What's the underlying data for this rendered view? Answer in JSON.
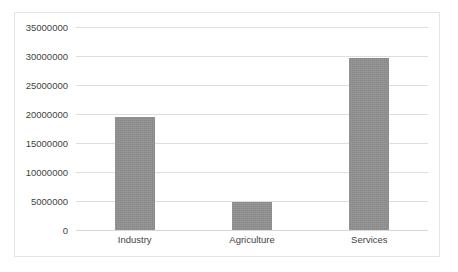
{
  "chart_data": {
    "type": "bar",
    "title": "",
    "subtitle": "",
    "xlabel": "",
    "ylabel": "",
    "categories": [
      "Industry",
      "Agriculture",
      "Services"
    ],
    "values": [
      19500000,
      4800000,
      29600000
    ],
    "series": [
      {
        "name": "",
        "values": [
          19500000,
          4800000,
          29600000
        ]
      }
    ],
    "ylim": [
      0,
      35000000
    ],
    "y_ticks": [
      0,
      5000000,
      10000000,
      15000000,
      20000000,
      25000000,
      30000000,
      35000000
    ],
    "y_tick_labels": [
      "0",
      "5000000",
      "10000000",
      "15000000",
      "20000000",
      "25000000",
      "30000000",
      "35000000"
    ],
    "grid": true,
    "grid_axis": "y",
    "legend": false,
    "legend_position": "none",
    "annotations": [],
    "colors": {
      "bar_fill": "#8e8e8e",
      "gridline": "#dedede",
      "border": "#e4e4e4",
      "text": "#3f3f3f",
      "background": "#ffffff"
    }
  }
}
